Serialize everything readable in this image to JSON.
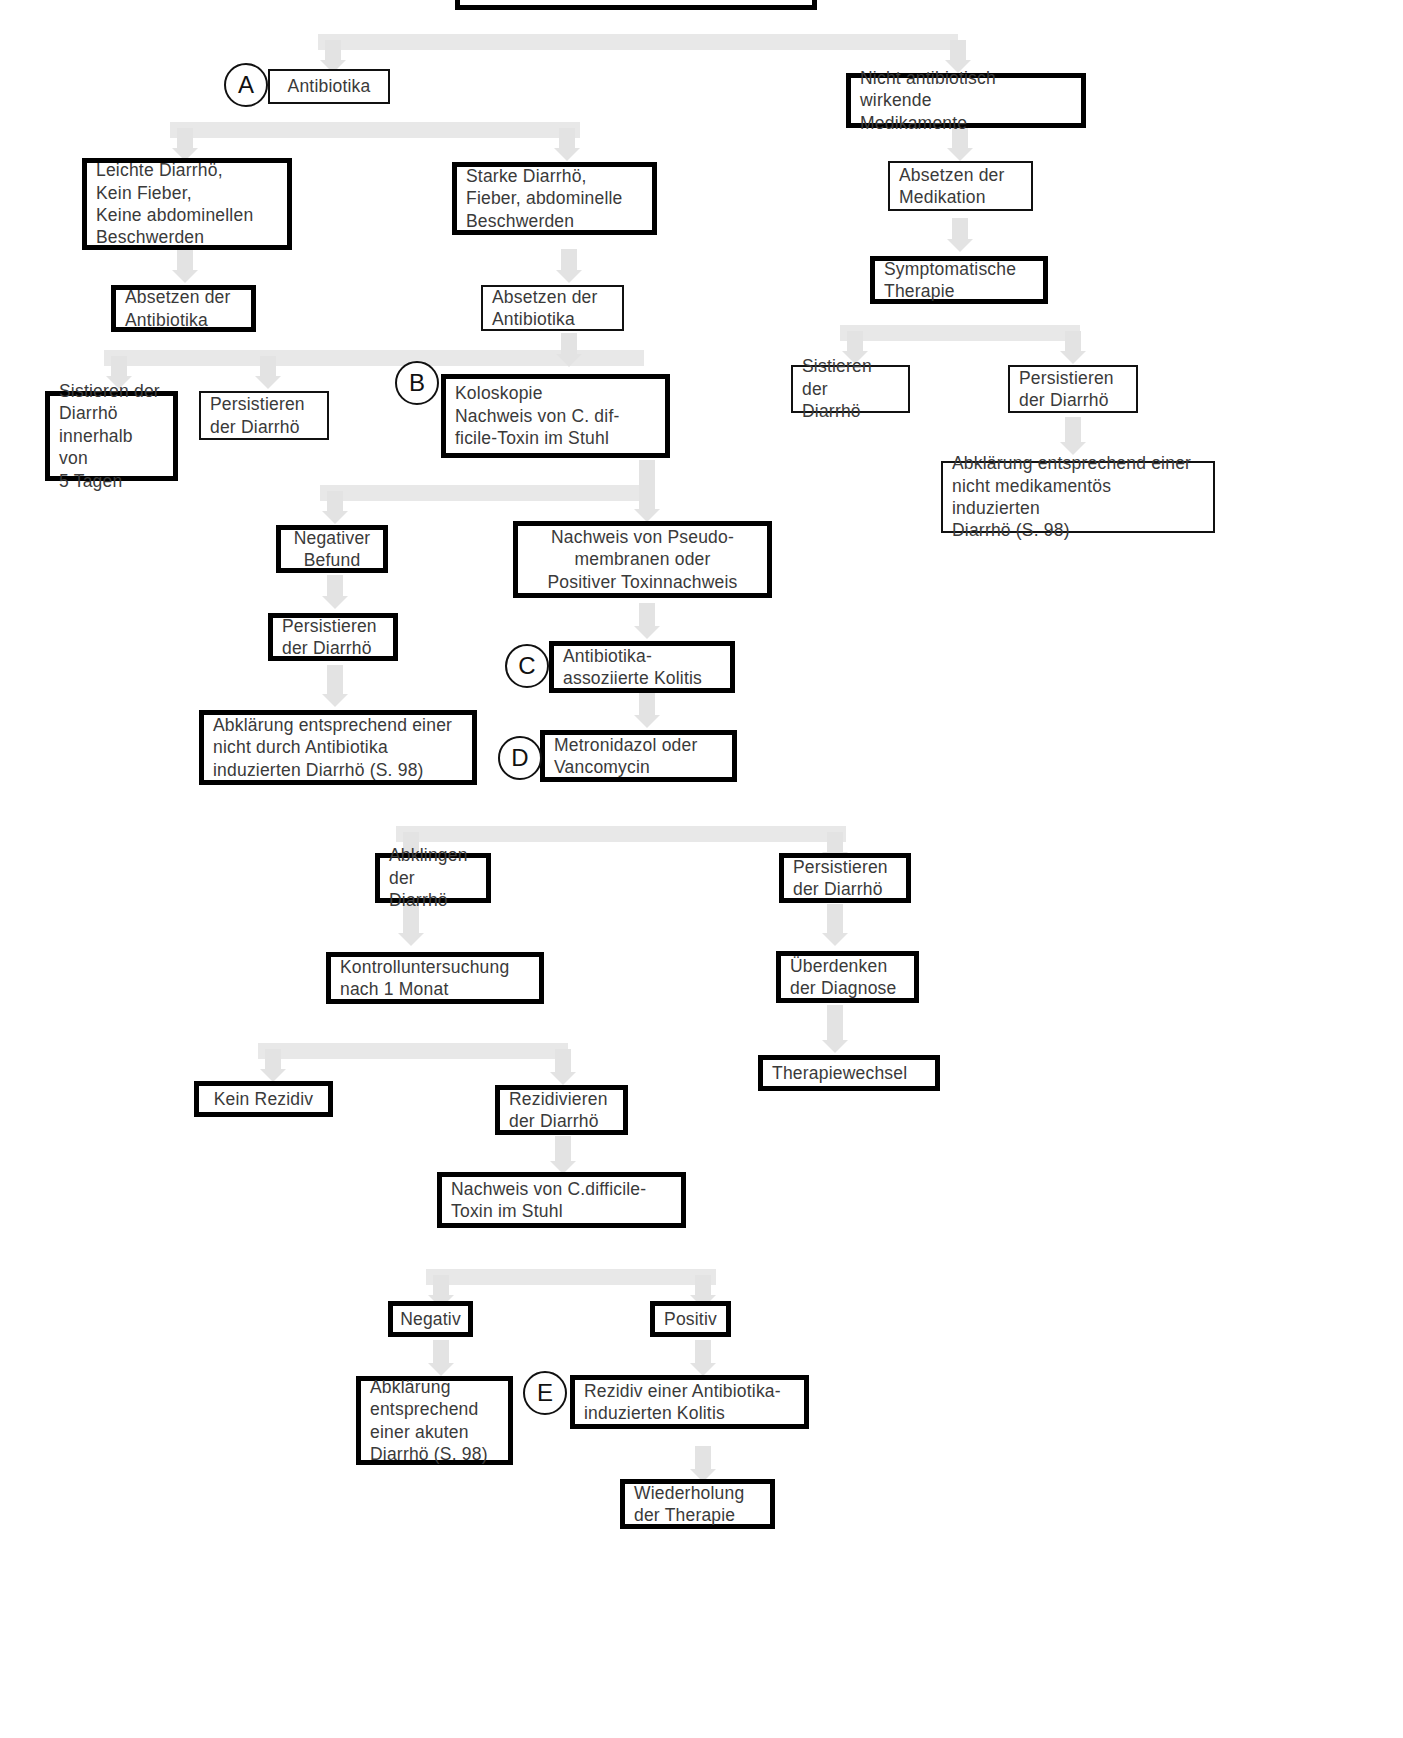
{
  "diagram": {
    "language": "de",
    "badges": [
      {
        "id": "A",
        "label": "A"
      },
      {
        "id": "B",
        "label": "B"
      },
      {
        "id": "C",
        "label": "C"
      },
      {
        "id": "D",
        "label": "D"
      },
      {
        "id": "E",
        "label": "E"
      }
    ],
    "nodes": [
      {
        "id": "n_top",
        "text": "",
        "emphasis": "bold"
      },
      {
        "id": "n_antibiotika",
        "text": "Antibiotika",
        "emphasis": "normal"
      },
      {
        "id": "n_nicht_ab",
        "text": "Nicht antibiotisch wirkende\nMedikamente",
        "emphasis": "bold"
      },
      {
        "id": "n_leichte",
        "text": "Leichte Diarrhö,\nKein Fieber,\nKeine abdominellen\n   Beschwerden",
        "emphasis": "bold"
      },
      {
        "id": "n_starke",
        "text": "Starke Diarrhö,\nFieber, abdominelle\nBeschwerden",
        "emphasis": "bold"
      },
      {
        "id": "n_absetzen_med",
        "text": "Absetzen der\nMedikation",
        "emphasis": "normal"
      },
      {
        "id": "n_absetzen_ab_l",
        "text": "Absetzen der\nAntibiotika",
        "emphasis": "bold"
      },
      {
        "id": "n_absetzen_ab_m",
        "text": "Absetzen der\nAntibiotika",
        "emphasis": "normal"
      },
      {
        "id": "n_sympt_therapie",
        "text": "Symptomatische\nTherapie",
        "emphasis": "bold"
      },
      {
        "id": "n_sistieren_5t",
        "text": "Sistieren der\nDiarrhö\ninnerhalb von\n5 Tagen",
        "emphasis": "bold"
      },
      {
        "id": "n_persistieren_l",
        "text": "Persistieren\nder Diarrhö",
        "emphasis": "normal"
      },
      {
        "id": "n_koloskopie",
        "text": "Koloskopie\nNachweis von C. dif-\nficile-Toxin im Stuhl",
        "emphasis": "bold"
      },
      {
        "id": "n_sistieren_r",
        "text": "Sistieren der\nDiarrhö",
        "emphasis": "normal"
      },
      {
        "id": "n_persistieren_r",
        "text": "Persistieren\nder Diarrhö",
        "emphasis": "normal"
      },
      {
        "id": "n_abkl_nicht_med",
        "text": "Abklärung entsprechend einer\nnicht medikamentös induzierten\nDiarrhö (S. 98)",
        "emphasis": "normal"
      },
      {
        "id": "n_negativer",
        "text": "Negativer\nBefund",
        "emphasis": "bold"
      },
      {
        "id": "n_pseudo",
        "text": "Nachweis von Pseudo-\n  membranen      oder\nPositiver Toxinnachweis",
        "emphasis": "bold"
      },
      {
        "id": "n_persistieren_m",
        "text": "Persistieren\nder Diarrhö",
        "emphasis": "bold"
      },
      {
        "id": "n_ab_kolitis",
        "text": "Antibiotika-\nassoziierte Kolitis",
        "emphasis": "bold"
      },
      {
        "id": "n_abkl_nicht_ab",
        "text": "Abklärung entsprechend einer\nnicht durch Antibiotika\ninduzierten Diarrhö (S. 98)",
        "emphasis": "bold"
      },
      {
        "id": "n_metronidazol",
        "text": "Metronidazol oder\nVancomycin",
        "emphasis": "bold"
      },
      {
        "id": "n_abklingen",
        "text": "Abklingen\nder Diarrhö",
        "emphasis": "bold"
      },
      {
        "id": "n_persistieren_b",
        "text": "Persistieren\nder Diarrhö",
        "emphasis": "bold"
      },
      {
        "id": "n_kontrolle",
        "text": "Kontrolluntersuchung\nnach 1 Monat",
        "emphasis": "bold"
      },
      {
        "id": "n_ueberdenken",
        "text": "Überdenken\nder Diagnose",
        "emphasis": "bold"
      },
      {
        "id": "n_therapiewechsel",
        "text": "Therapiewechsel",
        "emphasis": "bold"
      },
      {
        "id": "n_kein_rezidiv",
        "text": "Kein Rezidiv",
        "emphasis": "bold"
      },
      {
        "id": "n_rezidivieren",
        "text": "Rezidivieren\nder Diarrhö",
        "emphasis": "bold"
      },
      {
        "id": "n_nachweis_toxin",
        "text": "Nachweis von C.difficile-\nToxin im Stuhl",
        "emphasis": "bold"
      },
      {
        "id": "n_negativ",
        "text": "Negativ",
        "emphasis": "bold"
      },
      {
        "id": "n_positiv",
        "text": "Positiv",
        "emphasis": "bold"
      },
      {
        "id": "n_abkl_akut",
        "text": "Abklärung\nentsprechend\neiner akuten\nDiarrhö (S. 98)",
        "emphasis": "bold"
      },
      {
        "id": "n_rezidiv_kolitis",
        "text": "Rezidiv einer Antibiotika-\ninduzierten Kolitis",
        "emphasis": "bold"
      },
      {
        "id": "n_wiederholung",
        "text": "Wiederholung\nder Therapie",
        "emphasis": "bold"
      }
    ],
    "colors": {
      "box_border": "#111111",
      "text": "#3a3a3a",
      "connector": "#e3e3e3",
      "background": "#ffffff"
    }
  }
}
